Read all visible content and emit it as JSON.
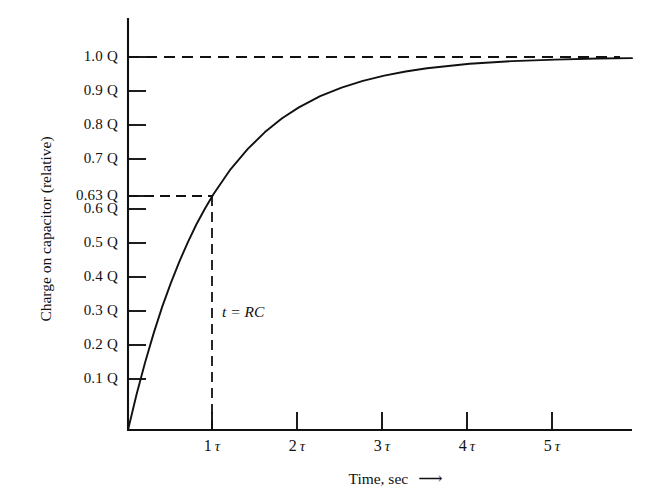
{
  "figure": {
    "background_color": "#ffffff",
    "ink_color": "#111111"
  },
  "chart_data": {
    "type": "line",
    "title": "",
    "subtitle": "",
    "xlabel": "Time, sec",
    "xlabel_arrow": "⟶",
    "ylabel": "Charge on capacitor (relative)",
    "grid": false,
    "legend": "none",
    "xlim": [
      0,
      5.9
    ],
    "ylim": [
      0,
      1.06
    ],
    "x_tick_values": [
      1,
      2,
      3,
      4,
      5
    ],
    "x_tick_labels": [
      "1",
      "2",
      "3",
      "4",
      "5"
    ],
    "x_tick_unit": "τ",
    "y_tick_values": [
      0.1,
      0.2,
      0.3,
      0.4,
      0.5,
      0.6,
      0.63,
      0.7,
      0.8,
      0.9,
      1.0
    ],
    "y_tick_labels": [
      "0.1 Q",
      "0.2 Q",
      "0.3 Q",
      "0.4 Q",
      "0.5 Q",
      "0.6 Q",
      "0.63 Q",
      "0.7 Q",
      "0.8 Q",
      "0.9 Q",
      "1.0 Q"
    ],
    "series": [
      {
        "name": "Capacitor charging curve",
        "equation": "Q(t) = Q(1 - e^(-t/RC))",
        "x": [
          0,
          0.1,
          0.2,
          0.3,
          0.4,
          0.5,
          0.6,
          0.7,
          0.8,
          0.9,
          1.0,
          1.2,
          1.4,
          1.6,
          1.8,
          2.0,
          2.25,
          2.5,
          2.75,
          3.0,
          3.25,
          3.5,
          3.75,
          4.0,
          4.5,
          5.0,
          5.5,
          5.9
        ],
        "y": [
          0,
          0.095,
          0.181,
          0.259,
          0.33,
          0.393,
          0.451,
          0.503,
          0.551,
          0.593,
          0.632,
          0.699,
          0.753,
          0.798,
          0.835,
          0.865,
          0.895,
          0.918,
          0.936,
          0.95,
          0.961,
          0.97,
          0.976,
          0.982,
          0.989,
          0.993,
          0.996,
          0.997
        ]
      }
    ],
    "annotations": [
      {
        "name": "time-constant-label",
        "text": "t = RC",
        "x": 1.0,
        "y": 0.3,
        "style": "italic"
      },
      {
        "name": "asymptote-line",
        "kind": "horizontal-dashed",
        "y": 1.0,
        "from_x": 0,
        "to_x": 5.75
      },
      {
        "name": "tau-level-line",
        "kind": "horizontal-dashed",
        "y": 0.63,
        "from_x": 0,
        "to_x": 1.0
      },
      {
        "name": "tau-time-line",
        "kind": "vertical-dashed",
        "x": 1.0,
        "from_y": 0,
        "to_y": 0.63
      }
    ]
  }
}
